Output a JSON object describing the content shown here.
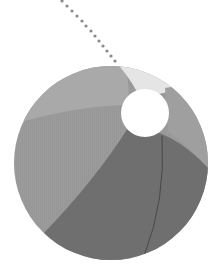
{
  "illustration": {
    "subject": "beach ball",
    "description": "Grayscale beach ball with a dotted trajectory line",
    "colors": {
      "background": "#ffffff",
      "segment_top": "#a9a9a9",
      "segment_top_right": "#e5e5e5",
      "segment_right": "#9f9f9f",
      "segment_left": "#9b9b9b",
      "segment_bottom": "#6f6f6f",
      "valve_hole": "#ffffff",
      "seam_line": "#444444",
      "trail_dots": "#8a8a8a"
    }
  }
}
